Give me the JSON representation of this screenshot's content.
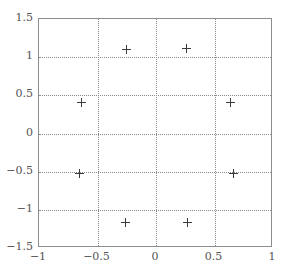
{
  "chart_data": {
    "type": "scatter",
    "title": "",
    "xlabel": "",
    "ylabel": "",
    "xlim": [
      -1,
      1
    ],
    "ylim": [
      -1.5,
      1.5
    ],
    "grid": true,
    "legend": null,
    "marker": "plus",
    "marker_color": "#3a3a3a",
    "xticks": [
      -1,
      -0.5,
      0,
      0.5,
      1
    ],
    "xticklabels": [
      "−1",
      "−0.5",
      "0",
      "0.5",
      "1"
    ],
    "yticks": [
      -1.5,
      -1,
      -0.5,
      0,
      0.5,
      1,
      1.5
    ],
    "yticklabels": [
      "−1.5",
      "−1",
      "−0.5",
      "0",
      "0.5",
      "1",
      "1.5"
    ],
    "points": [
      {
        "x": -0.25,
        "y": 1.1
      },
      {
        "x": 0.26,
        "y": 1.11
      },
      {
        "x": -0.64,
        "y": 0.41
      },
      {
        "x": 0.64,
        "y": 0.41
      },
      {
        "x": -0.65,
        "y": -0.52
      },
      {
        "x": 0.66,
        "y": -0.52
      },
      {
        "x": -0.26,
        "y": -1.16
      },
      {
        "x": 0.27,
        "y": -1.16
      }
    ]
  },
  "figure": {
    "background": "#ffffff",
    "frame_color": "#8d8d8d",
    "grid_color": "#8a8a8a",
    "tick_label_color": "#555555"
  }
}
